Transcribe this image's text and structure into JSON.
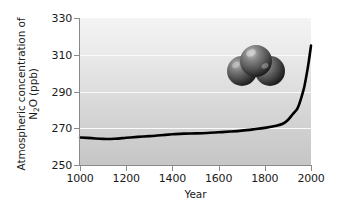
{
  "chart_data": {
    "type": "line",
    "title": "",
    "xlabel": "Year",
    "ylabel_line1": "Atmospheric concentration of",
    "ylabel_line2_pre": "N",
    "ylabel_line2_sub": "2",
    "ylabel_line2_post": "O (ppb)",
    "ylabel_plain": "Atmospheric concentration of N2O (ppb)",
    "xlim": [
      1000,
      2000
    ],
    "ylim": [
      250,
      330
    ],
    "xticks": [
      1000,
      1200,
      1400,
      1600,
      1800,
      2000
    ],
    "yticks": [
      250,
      270,
      290,
      310,
      330
    ],
    "xtick_labels": [
      "1000",
      "1200",
      "1400",
      "1600",
      "1800",
      "2000"
    ],
    "ytick_labels": [
      "250",
      "270",
      "290",
      "310",
      "330"
    ],
    "grid": "horizontal-white",
    "legend": "none",
    "series": [
      {
        "name": "N2O concentration",
        "color": "#000000",
        "x": [
          1000,
          1050,
          1100,
          1150,
          1200,
          1250,
          1300,
          1350,
          1400,
          1450,
          1500,
          1550,
          1600,
          1650,
          1700,
          1750,
          1800,
          1850,
          1880,
          1900,
          1920,
          1940,
          1950,
          1960,
          1970,
          1980,
          1990,
          2000
        ],
        "values": [
          265.0,
          264.6,
          264.2,
          264.3,
          264.8,
          265.3,
          265.7,
          266.2,
          266.7,
          267.1,
          267.2,
          267.4,
          267.8,
          268.2,
          268.7,
          269.4,
          270.2,
          271.4,
          272.6,
          274.5,
          277.5,
          280.5,
          283.5,
          287.5,
          292.0,
          298.5,
          306.0,
          315.0
        ]
      }
    ],
    "annotations": [
      {
        "name": "n2o-molecule-model",
        "type": "space-filling-molecule",
        "atoms": 3,
        "color": "#4a4a4a"
      }
    ]
  }
}
